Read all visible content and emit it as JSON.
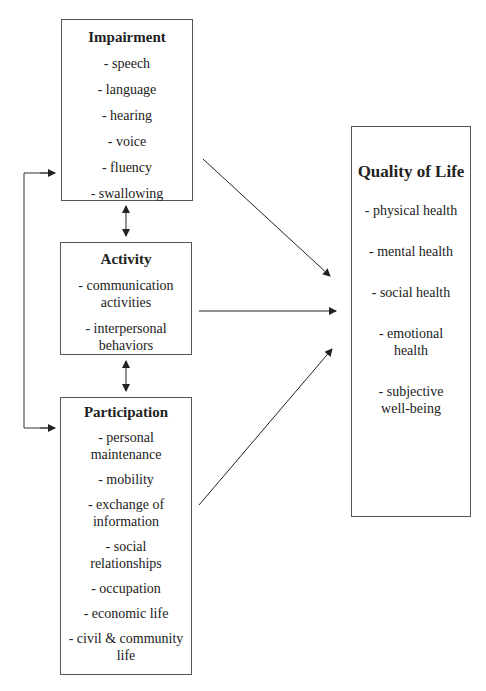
{
  "impairment": {
    "title": "Impairment",
    "items": [
      "- speech",
      "- language",
      "- hearing",
      "- voice",
      "- fluency",
      "- swallowing"
    ]
  },
  "activity": {
    "title": "Activity",
    "items": [
      "- communication activities",
      "- interpersonal behaviors"
    ]
  },
  "participation": {
    "title": "Participation",
    "items": [
      "- personal maintenance",
      "- mobility",
      "- exchange of information",
      "- social relationships",
      "- occupation",
      "- economic life",
      "- civil & community life"
    ]
  },
  "quality_of_life": {
    "title": "Quality of Life",
    "items": [
      "- physical health",
      "- mental health",
      "- social health",
      "- emotional health",
      "- subjective well-being"
    ]
  },
  "colors": {
    "line": "#222222",
    "border": "#555555"
  }
}
